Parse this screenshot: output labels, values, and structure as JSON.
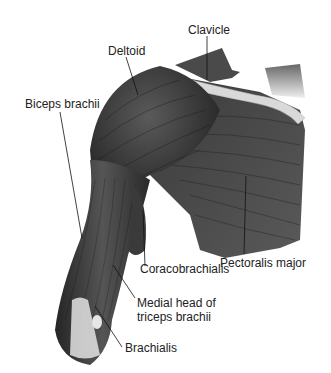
{
  "figure": {
    "labels": {
      "deltoid": "Deltoid",
      "clavicle": "Clavicle",
      "biceps": "Biceps brachii",
      "coracobrachialis": "Coracobrachialis",
      "pectoralis": "Pectoralis major",
      "medial_head_1": "Medial head of",
      "medial_head_2": "triceps brachii",
      "brachialis": "Brachialis"
    },
    "colors": {
      "muscle_dark": "#2a2a2a",
      "muscle_mid": "#4a4a4a",
      "muscle_light": "#6a6a6a",
      "bone": "#d8d8d8",
      "tendon": "#e6e6e6",
      "leader_line": "#111111",
      "text": "#222222"
    }
  }
}
